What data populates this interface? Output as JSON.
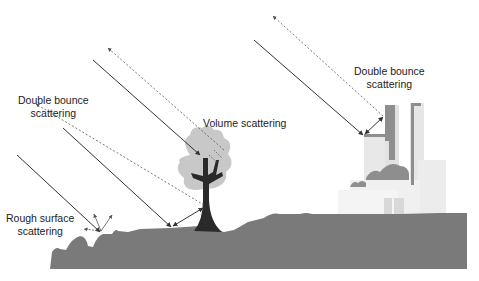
{
  "diagram": {
    "labels": {
      "double_bounce_left": [
        "Double bounce",
        "scattering"
      ],
      "volume": "Volume scattering",
      "double_bounce_right": [
        "Double bounce",
        "scattering"
      ],
      "rough_surface": [
        "Rough surface",
        "scattering"
      ]
    },
    "colors": {
      "ground": "#7a7a7a",
      "canopy": "#c8c8c8",
      "trunk": "#2a2a2a",
      "building_light": "#e6e6e6",
      "building_dark": "#8a8a8a",
      "arrow": "#333333"
    }
  }
}
